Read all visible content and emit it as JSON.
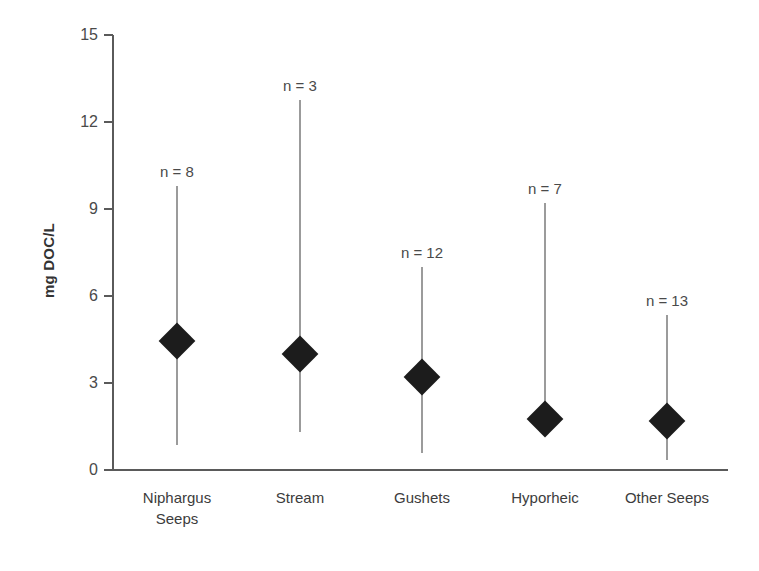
{
  "chart_data": {
    "type": "scatter",
    "title": "",
    "xlabel": "",
    "ylabel": "mg DOC/L",
    "ylim": [
      0,
      15
    ],
    "yticks": [
      0,
      3,
      6,
      9,
      12,
      15
    ],
    "grid": false,
    "legend": "none",
    "marker_style": "filled-diamond",
    "error_bar_style": "vertical-range-line",
    "categories": [
      "Niphargus Seeps",
      "Stream",
      "Gushets",
      "Hyporheic",
      "Other Seeps"
    ],
    "category_lines": [
      [
        "Niphargus",
        "Seeps"
      ],
      [
        "Stream"
      ],
      [
        "Gushets"
      ],
      [
        "Hyporheic"
      ],
      [
        "Other Seeps"
      ]
    ],
    "values": [
      4.45,
      4.0,
      3.2,
      1.75,
      1.7
    ],
    "upper": [
      9.8,
      12.75,
      7.0,
      9.2,
      5.35
    ],
    "lower": [
      0.85,
      1.3,
      0.6,
      1.75,
      0.35
    ],
    "n_counts": [
      8,
      3,
      12,
      7,
      13
    ],
    "annotations": [
      "n = 8",
      "n = 3",
      "n = 12",
      "n = 7",
      "n = 13"
    ],
    "colors": {
      "marker": "#1c1c1c",
      "whisker": "#9b9b9b",
      "axis": "#5a5a5a",
      "text": "#3c3c3c",
      "background": "#ffffff"
    }
  },
  "axis": {
    "y_title": "mg DOC/L",
    "y_tick_labels": [
      "0",
      "3",
      "6",
      "9",
      "12",
      "15"
    ]
  }
}
